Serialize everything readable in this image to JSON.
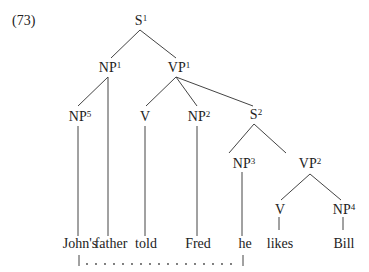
{
  "example_number": "(73)",
  "nodes": {
    "s1": {
      "cat": "S",
      "idx": "1"
    },
    "np1": {
      "cat": "NP",
      "idx": "1"
    },
    "vp1": {
      "cat": "VP",
      "idx": "1"
    },
    "np5": {
      "cat": "NP",
      "idx": "5"
    },
    "v1": {
      "cat": "V",
      "idx": ""
    },
    "np2": {
      "cat": "NP",
      "idx": "2"
    },
    "s2": {
      "cat": "S",
      "idx": "2"
    },
    "np3": {
      "cat": "NP",
      "idx": "3"
    },
    "vp2": {
      "cat": "VP",
      "idx": "2"
    },
    "v2": {
      "cat": "V",
      "idx": ""
    },
    "np4": {
      "cat": "NP",
      "idx": "4"
    }
  },
  "leaves": [
    "John's",
    "father",
    "told",
    "Fred",
    "he",
    "likes",
    "Bill"
  ],
  "coreference": {
    "from": "John's",
    "to": "he",
    "style": "dotted"
  }
}
